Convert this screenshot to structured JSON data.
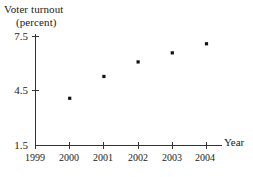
{
  "chart_data": {
    "type": "scatter",
    "title": "Voter turnout (percent)",
    "title_line1": "Voter turnout",
    "title_line2": "(percent)",
    "xlabel": "Year",
    "ylabel": "Voter turnout (percent)",
    "categories": [
      "1999",
      "2000",
      "2001",
      "2002",
      "2003",
      "2004"
    ],
    "x": [
      1999,
      2000,
      2001,
      2002,
      2003,
      2004
    ],
    "values": [
      null,
      4.1,
      5.3,
      6.1,
      6.6,
      7.1
    ],
    "points": [
      {
        "x": "2000",
        "y": 4.1
      },
      {
        "x": "2001",
        "y": 5.3
      },
      {
        "x": "2002",
        "y": 6.1
      },
      {
        "x": "2003",
        "y": 6.6
      },
      {
        "x": "2004",
        "y": 7.1
      }
    ],
    "xlim": [
      1999,
      2004
    ],
    "ylim": [
      1.5,
      7.5
    ],
    "ytick_labels": [
      "7.5",
      "4.5",
      "1.5"
    ],
    "ytick_values": [
      7.5,
      4.5,
      1.5
    ],
    "xtick_labels": [
      "1999",
      "2000",
      "2001",
      "2002",
      "2003",
      "2004"
    ],
    "grid": false,
    "legend": null,
    "marker_color": "#111111",
    "axis_color": "#333333",
    "background": "#ffffff"
  },
  "axes": {
    "year_label": "Year",
    "y_ticks": [
      {
        "label": "7.5"
      },
      {
        "label": "4.5"
      },
      {
        "label": "1.5"
      }
    ],
    "x_ticks": [
      {
        "label": "1999"
      },
      {
        "label": "2000"
      },
      {
        "label": "2001"
      },
      {
        "label": "2002"
      },
      {
        "label": "2003"
      },
      {
        "label": "2004"
      }
    ]
  }
}
